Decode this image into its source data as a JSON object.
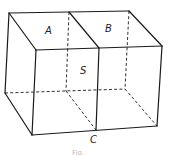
{
  "figure": {
    "labels": {
      "A": "A",
      "B": "B",
      "S": "S",
      "C": "C"
    },
    "caption": "Fig."
  },
  "colors": {
    "line": "#1a1a1a",
    "background": "#ffffff"
  }
}
